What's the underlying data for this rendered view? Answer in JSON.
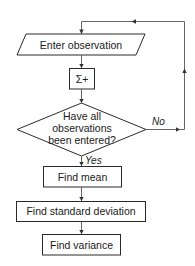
{
  "diagram": {
    "type": "flowchart",
    "colors": {
      "stroke": "#2a2a2a",
      "edge": "#555555",
      "text": "#1a1a1a",
      "background": "#ffffff"
    },
    "nodes": {
      "input": {
        "shape": "parallelogram",
        "label": "Enter observation"
      },
      "sum": {
        "shape": "rectangle",
        "label": "Σ+"
      },
      "decision": {
        "shape": "diamond",
        "lines": [
          "Have all",
          "observations",
          "been entered?"
        ]
      },
      "mean": {
        "shape": "rectangle",
        "label": "Find mean"
      },
      "stddev": {
        "shape": "rectangle",
        "label": "Find standard deviation"
      },
      "variance": {
        "shape": "rectangle",
        "label": "Find variance"
      }
    },
    "edges": {
      "no_label": "No",
      "yes_label": "Yes"
    }
  }
}
